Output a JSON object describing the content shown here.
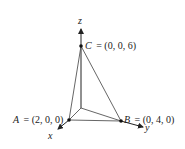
{
  "diagram": {
    "axes": {
      "x_label": "x",
      "y_label": "y",
      "z_label": "z"
    },
    "points": {
      "A": {
        "name": "A",
        "coords": "= (2, 0, 0)"
      },
      "B": {
        "name": "B",
        "coords": "= (0, 4, 0)"
      },
      "C": {
        "name": "C",
        "coords": "= (0, 0, 6)"
      }
    },
    "colors": {
      "line": "#555555",
      "axis": "#222222",
      "point": "#111111"
    }
  }
}
